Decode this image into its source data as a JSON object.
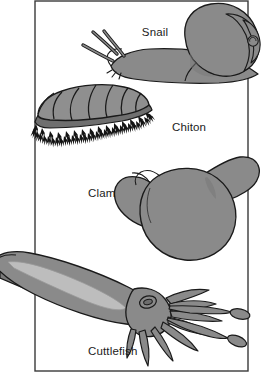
{
  "figure": {
    "background_color": "#ffffff",
    "frame": {
      "name": "figure-border",
      "stroke_color": "#3a3a3a",
      "stroke_width": 1.4,
      "x": 35,
      "y": 1,
      "width": 213,
      "height": 370
    },
    "palette": {
      "outline": "#1a1a1a",
      "body_fill": "#8a8a8a",
      "shell_fill": "#8f8f8f",
      "shade_fill": "#777777",
      "highlight_fill": "#bdbdbd",
      "bristle": "#141414",
      "label_color": "#1b1b1b"
    },
    "organisms": [
      {
        "id": "snail",
        "label": "Snail",
        "label_x": 155,
        "label_y": 36,
        "group": "Gastropoda",
        "features": [
          "coiled spiral shell",
          "muscular foot",
          "two pairs of tentacles"
        ]
      },
      {
        "id": "chiton",
        "label": "Chiton",
        "label_x": 172,
        "label_y": 131,
        "group": "Polyplacophora",
        "features": [
          "eight overlapping dorsal plates",
          "bristly girdle"
        ]
      },
      {
        "id": "clam",
        "label": "Clam",
        "label_x": 88,
        "label_y": 197,
        "group": "Bivalvia",
        "features": [
          "two hinged valves",
          "extended siphon"
        ]
      },
      {
        "id": "cuttlefish",
        "label": "Cuttlefish",
        "label_x": 88,
        "label_y": 355,
        "group": "Cephalopoda",
        "features": [
          "mantle with lateral fin",
          "eight arms",
          "two feeding tentacles with clubs",
          "large eye"
        ]
      }
    ]
  }
}
